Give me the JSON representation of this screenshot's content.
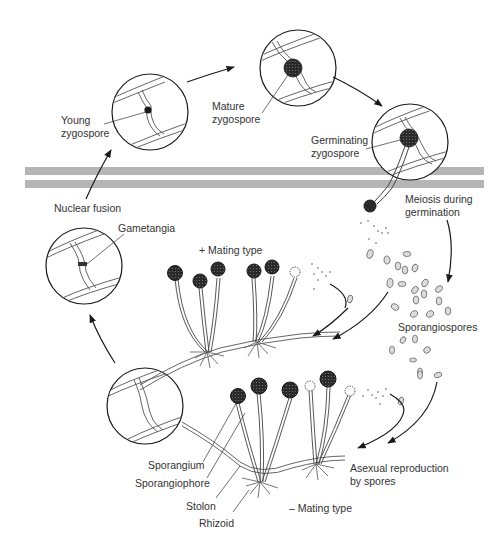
{
  "diagram": {
    "colors": {
      "ink": "#1a1a1a",
      "label": "#333333",
      "band": "#b5b5b5",
      "sporangium": "#2b2b2b",
      "spore": "#d8d8d8"
    },
    "bands": [
      {
        "name": "upper-band",
        "y": 167,
        "height": 8
      },
      {
        "name": "lower-band",
        "y": 180,
        "height": 8
      }
    ],
    "stages": [
      {
        "id": "young-zygospore",
        "label_line1": "Young",
        "label_line2": "zygospore"
      },
      {
        "id": "mature-zygospore",
        "label_line1": "Mature",
        "label_line2": "zygospore"
      },
      {
        "id": "germinating-zygospore",
        "label_line1": "Germinating",
        "label_line2": "zygospore"
      },
      {
        "id": "gametangia",
        "label": "Gametangia"
      }
    ],
    "labels": {
      "nuclear_fusion": "Nuclear fusion",
      "meiosis_line1": "Meiosis during",
      "meiosis_line2": "germination",
      "plus_mating": "+ Mating type",
      "minus_mating": "– Mating type",
      "sporangiospores": "Sporangiospores",
      "asexual_line1": "Asexual reproduction",
      "asexual_line2": "by spores",
      "sporangium": "Sporangium",
      "sporangiophore": "Sporangiophore",
      "stolon": "Stolon",
      "rhizoid": "Rhizoid"
    },
    "arrows": [
      {
        "from": "young-zygospore",
        "to": "mature-zygospore"
      },
      {
        "from": "mature-zygospore",
        "to": "germinating-zygospore"
      },
      {
        "from": "meiosis",
        "to": "sporangiospores"
      },
      {
        "from": "sporangiospores",
        "to": "plus-mating-type"
      },
      {
        "from": "sporangiospores",
        "to": "minus-mating-type"
      },
      {
        "from": "plus-mating-type",
        "to": "plus-mating-type"
      },
      {
        "from": "minus-mating-type",
        "to": "minus-mating-type"
      },
      {
        "from": "bottom-circle",
        "to": "gametangia"
      },
      {
        "from": "nuclear-fusion",
        "to": "young-zygospore"
      }
    ]
  }
}
